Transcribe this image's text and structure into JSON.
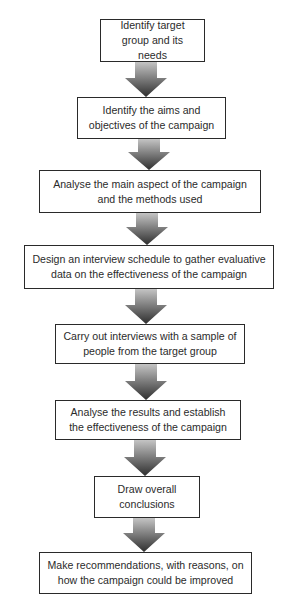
{
  "diagram": {
    "type": "flowchart",
    "direction": "top-to-bottom",
    "colors": {
      "box_border": "#2a2a2a",
      "text": "#2b2b2b",
      "arrow_top": "#c4c4c4",
      "arrow_bottom": "#2e2e2e"
    },
    "steps": [
      {
        "id": 1,
        "label": "Identify target group and its needs",
        "box": {
          "x": 100,
          "y": 19,
          "w": 105,
          "h": 43
        }
      },
      {
        "id": 2,
        "label": "Identify the aims and objectives of the campaign",
        "box": {
          "x": 77,
          "y": 97,
          "w": 149,
          "h": 42
        }
      },
      {
        "id": 3,
        "label": "Analyse the main aspect of the campaign and the methods used",
        "box": {
          "x": 39,
          "y": 170,
          "w": 222,
          "h": 43
        }
      },
      {
        "id": 4,
        "label": "Design an interview schedule to gather evaluative data on the effectiveness of the campaign",
        "box": {
          "x": 24,
          "y": 245,
          "w": 250,
          "h": 44
        }
      },
      {
        "id": 5,
        "label": "Carry out interviews with a sample of people from the target group",
        "box": {
          "x": 55,
          "y": 324,
          "w": 190,
          "h": 40
        }
      },
      {
        "id": 6,
        "label": "Analyse the results and establish the effectiveness of the campaign",
        "box": {
          "x": 55,
          "y": 400,
          "w": 186,
          "h": 40
        }
      },
      {
        "id": 7,
        "label": "Draw overall conclusions",
        "box": {
          "x": 94,
          "y": 476,
          "w": 106,
          "h": 42
        }
      },
      {
        "id": 8,
        "label": "Make recommendations, with reasons, on how the campaign could be improved",
        "box": {
          "x": 39,
          "y": 552,
          "w": 213,
          "h": 42
        }
      }
    ],
    "arrows": [
      {
        "from": 1,
        "to": 2,
        "cx": 146,
        "y1": 62,
        "y2": 97
      },
      {
        "from": 2,
        "to": 3,
        "cx": 149,
        "y1": 139,
        "y2": 170
      },
      {
        "from": 3,
        "to": 4,
        "cx": 147,
        "y1": 213,
        "y2": 245
      },
      {
        "from": 4,
        "to": 5,
        "cx": 146,
        "y1": 289,
        "y2": 324
      },
      {
        "from": 5,
        "to": 6,
        "cx": 146,
        "y1": 364,
        "y2": 400
      },
      {
        "from": 6,
        "to": 7,
        "cx": 145,
        "y1": 440,
        "y2": 476
      },
      {
        "from": 7,
        "to": 8,
        "cx": 144,
        "y1": 518,
        "y2": 552
      }
    ]
  }
}
